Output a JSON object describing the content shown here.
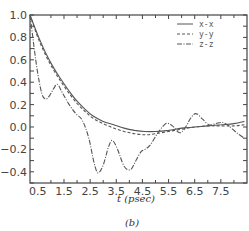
{
  "chart_data": {
    "type": "line",
    "title": "",
    "caption": "(b)",
    "xlabel": "t (psec)",
    "ylabel": "",
    "xlim": [
      0.2,
      8.5
    ],
    "ylim": [
      -0.5,
      1.0
    ],
    "grid": false,
    "legend_position": "upper right",
    "x_ticks": [
      0.5,
      1.5,
      2.5,
      3.5,
      4.5,
      5.5,
      6.5,
      7.5
    ],
    "x_tick_labels": [
      "0.5",
      "1.5",
      "2.5",
      "3.5",
      "4.5",
      "5.5",
      "6.5",
      "7.5"
    ],
    "y_ticks": [
      -0.4,
      -0.2,
      0.0,
      0.2,
      0.4,
      0.6,
      0.8,
      1.0
    ],
    "y_tick_labels": [
      "-0.4",
      "-0.2",
      "0.0",
      "0.2",
      "0.4",
      "0.6",
      "0.8",
      "1.0"
    ],
    "series": [
      {
        "name": "x-x",
        "style": "solid",
        "x": [
          0.2,
          0.5,
          0.8,
          1.1,
          1.4,
          1.7,
          2.0,
          2.3,
          2.6,
          3.0,
          3.4,
          3.8,
          4.2,
          4.6,
          5.0,
          5.5,
          6.0,
          6.5,
          7.0,
          7.5,
          8.0,
          8.4
        ],
        "y": [
          1.0,
          0.82,
          0.66,
          0.53,
          0.42,
          0.32,
          0.23,
          0.16,
          0.1,
          0.05,
          0.02,
          -0.01,
          -0.03,
          -0.04,
          -0.04,
          -0.03,
          -0.01,
          0.0,
          0.01,
          0.02,
          0.03,
          0.05
        ]
      },
      {
        "name": "y-y",
        "style": "dashed",
        "x": [
          0.2,
          0.5,
          0.8,
          1.1,
          1.4,
          1.7,
          2.0,
          2.3,
          2.6,
          3.0,
          3.4,
          3.8,
          4.2,
          4.6,
          5.0,
          5.5,
          6.0,
          6.5,
          7.0,
          7.5,
          8.0,
          8.4
        ],
        "y": [
          1.0,
          0.8,
          0.64,
          0.51,
          0.4,
          0.3,
          0.21,
          0.14,
          0.08,
          0.03,
          -0.01,
          -0.04,
          -0.06,
          -0.07,
          -0.06,
          -0.04,
          -0.02,
          0.0,
          0.01,
          0.01,
          0.01,
          0.02
        ]
      },
      {
        "name": "z-z",
        "style": "dash-dot",
        "x": [
          0.2,
          0.45,
          0.65,
          0.8,
          0.95,
          1.1,
          1.25,
          1.45,
          1.7,
          1.95,
          2.2,
          2.45,
          2.65,
          2.8,
          3.0,
          3.2,
          3.35,
          3.55,
          3.8,
          4.05,
          4.25,
          4.45,
          4.6,
          4.8,
          5.1,
          5.4,
          5.65,
          5.9,
          6.1,
          6.35,
          6.55,
          6.8,
          7.05,
          7.3,
          7.55,
          7.8,
          8.1,
          8.4
        ],
        "y": [
          1.0,
          0.55,
          0.3,
          0.25,
          0.28,
          0.34,
          0.38,
          0.3,
          0.2,
          0.12,
          0.06,
          -0.1,
          -0.32,
          -0.41,
          -0.34,
          -0.18,
          -0.12,
          -0.2,
          -0.35,
          -0.38,
          -0.3,
          -0.22,
          -0.2,
          -0.16,
          -0.05,
          0.03,
          0.01,
          -0.05,
          -0.02,
          0.08,
          0.12,
          0.07,
          0.02,
          0.03,
          0.04,
          0.01,
          -0.05,
          -0.1
        ]
      }
    ]
  },
  "legend": {
    "items": [
      {
        "label": "x-x",
        "style": "solid"
      },
      {
        "label": "y-y",
        "style": "dashed"
      },
      {
        "label": "z-z",
        "style": "dash-dot"
      }
    ]
  },
  "colors": {
    "axis": "#444444",
    "line": "#555555",
    "background": "#ffffff"
  }
}
